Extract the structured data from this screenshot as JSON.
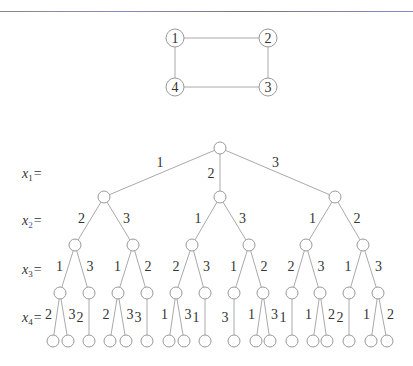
{
  "graph": {
    "nodes": [
      {
        "id": "1",
        "x": 175,
        "y": 38
      },
      {
        "id": "2",
        "x": 268,
        "y": 38
      },
      {
        "id": "4",
        "x": 175,
        "y": 87
      },
      {
        "id": "3",
        "x": 268,
        "y": 87
      }
    ],
    "edges": [
      [
        "1",
        "2"
      ],
      [
        "2",
        "3"
      ],
      [
        "3",
        "4"
      ],
      [
        "4",
        "1"
      ]
    ]
  },
  "tree": {
    "level_labels": [
      {
        "text": "x",
        "sub": "1",
        "suffix": "=",
        "y": 174
      },
      {
        "text": "x",
        "sub": "2",
        "suffix": "=",
        "y": 221
      },
      {
        "text": "x",
        "sub": "3",
        "suffix": "=",
        "y": 270
      },
      {
        "text": "x",
        "sub": "4",
        "suffix": "=",
        "y": 318
      }
    ],
    "root": {
      "x": 220,
      "y": 148
    },
    "level1": [
      {
        "x": 104,
        "y": 197,
        "edge_label": "1"
      },
      {
        "x": 220,
        "y": 197,
        "edge_label": "2"
      },
      {
        "x": 335,
        "y": 197,
        "edge_label": "3"
      }
    ],
    "level2": [
      {
        "parent": 0,
        "x": 75,
        "y": 245,
        "edge_label": "2"
      },
      {
        "parent": 0,
        "x": 133,
        "y": 245,
        "edge_label": "3"
      },
      {
        "parent": 1,
        "x": 192,
        "y": 245,
        "edge_label": "1"
      },
      {
        "parent": 1,
        "x": 249,
        "y": 245,
        "edge_label": "3"
      },
      {
        "parent": 2,
        "x": 306,
        "y": 245,
        "edge_label": "1"
      },
      {
        "parent": 2,
        "x": 363,
        "y": 245,
        "edge_label": "2"
      }
    ],
    "level3": [
      {
        "parent": 0,
        "x": 60,
        "y": 293,
        "edge_label": "1"
      },
      {
        "parent": 0,
        "x": 89,
        "y": 293,
        "edge_label": "3"
      },
      {
        "parent": 1,
        "x": 118,
        "y": 293,
        "edge_label": "1"
      },
      {
        "parent": 1,
        "x": 147,
        "y": 293,
        "edge_label": "2"
      },
      {
        "parent": 2,
        "x": 176,
        "y": 293,
        "edge_label": "2"
      },
      {
        "parent": 2,
        "x": 205,
        "y": 293,
        "edge_label": "3"
      },
      {
        "parent": 3,
        "x": 234,
        "y": 293,
        "edge_label": "1"
      },
      {
        "parent": 3,
        "x": 263,
        "y": 293,
        "edge_label": "2"
      },
      {
        "parent": 4,
        "x": 292,
        "y": 293,
        "edge_label": "2"
      },
      {
        "parent": 4,
        "x": 320,
        "y": 293,
        "edge_label": "3"
      },
      {
        "parent": 5,
        "x": 349,
        "y": 293,
        "edge_label": "1"
      },
      {
        "parent": 5,
        "x": 378,
        "y": 293,
        "edge_label": "3"
      }
    ],
    "level4": [
      {
        "parent": 0,
        "x": 53,
        "y": 341,
        "edge_label": "2"
      },
      {
        "parent": 0,
        "x": 68,
        "y": 341,
        "edge_label": "3"
      },
      {
        "parent": 1,
        "x": 89,
        "y": 341,
        "edge_label": "2"
      },
      {
        "parent": 2,
        "x": 110,
        "y": 341,
        "edge_label": "2"
      },
      {
        "parent": 2,
        "x": 126,
        "y": 341,
        "edge_label": "3"
      },
      {
        "parent": 3,
        "x": 147,
        "y": 341,
        "edge_label": "3"
      },
      {
        "parent": 4,
        "x": 169,
        "y": 341,
        "edge_label": "1"
      },
      {
        "parent": 4,
        "x": 184,
        "y": 341,
        "edge_label": "3"
      },
      {
        "parent": 5,
        "x": 205,
        "y": 341,
        "edge_label": "1"
      },
      {
        "parent": 6,
        "x": 234,
        "y": 341,
        "edge_label": "3"
      },
      {
        "parent": 7,
        "x": 256,
        "y": 341,
        "edge_label": "1"
      },
      {
        "parent": 7,
        "x": 270,
        "y": 341,
        "edge_label": "3"
      },
      {
        "parent": 8,
        "x": 292,
        "y": 341,
        "edge_label": "1"
      },
      {
        "parent": 9,
        "x": 313,
        "y": 341,
        "edge_label": "1"
      },
      {
        "parent": 9,
        "x": 327,
        "y": 341,
        "edge_label": "2"
      },
      {
        "parent": 10,
        "x": 349,
        "y": 341,
        "edge_label": "2"
      },
      {
        "parent": 11,
        "x": 371,
        "y": 341,
        "edge_label": "1"
      },
      {
        "parent": 11,
        "x": 387,
        "y": 341,
        "edge_label": "2"
      }
    ]
  },
  "colors": {
    "edge": "#aaaaaa",
    "node_stroke": "#999999",
    "text": "#333333"
  }
}
